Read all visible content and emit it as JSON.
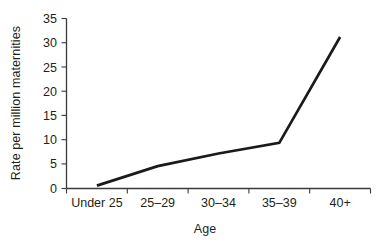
{
  "chart_data": {
    "type": "line",
    "title": "",
    "subtitle": "",
    "xlabel": "Age",
    "ylabel": "Rate per million maternities",
    "categories": [
      "Under 25",
      "25–29",
      "30–34",
      "35–39",
      "40+"
    ],
    "values": [
      0.6,
      4.6,
      7.2,
      9.4,
      31.2
    ],
    "series": [
      {
        "name": "Rate per million maternities",
        "values": [
          0.6,
          4.6,
          7.2,
          9.4,
          31.2
        ]
      }
    ],
    "ylim": [
      0,
      35
    ],
    "yticks": [
      0,
      5,
      10,
      15,
      20,
      25,
      30,
      35
    ],
    "ytick_labels": [
      "0",
      "5",
      "10",
      "15",
      "20",
      "25",
      "30",
      "35"
    ],
    "xtick_labels": [
      "Under 25",
      "25–29",
      "30–34",
      "35–39",
      "40+"
    ],
    "grid": false,
    "legend": false,
    "legend_position": "none",
    "line_color": "#1a1a1a",
    "axis_color": "#3a3a3a",
    "text_color": "#231f20",
    "background_color": "#ffffff",
    "annotations": []
  },
  "axes": {
    "y_title": "Rate per million maternities",
    "x_title": "Age",
    "y_ticks": [
      {
        "label": "35",
        "value": 35
      },
      {
        "label": "30",
        "value": 30
      },
      {
        "label": "25",
        "value": 25
      },
      {
        "label": "20",
        "value": 20
      },
      {
        "label": "15",
        "value": 15
      },
      {
        "label": "10",
        "value": 10
      },
      {
        "label": "5",
        "value": 5
      },
      {
        "label": "0",
        "value": 0
      }
    ],
    "x_ticks": [
      {
        "label": "Under 25"
      },
      {
        "label": "25–29"
      },
      {
        "label": "30–34"
      },
      {
        "label": "35–39"
      },
      {
        "label": "40+"
      }
    ]
  }
}
